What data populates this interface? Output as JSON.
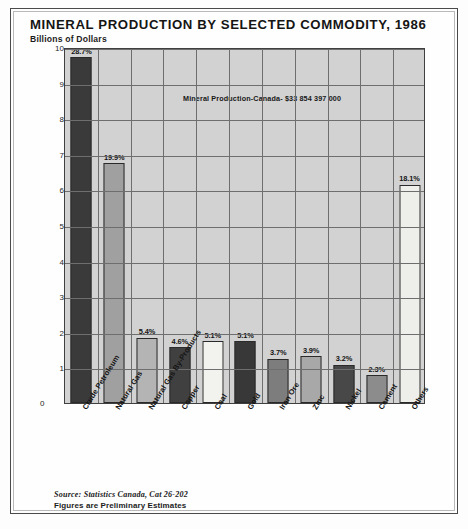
{
  "chart_data": {
    "type": "bar",
    "title": "MINERAL PRODUCTION BY SELECTED COMMODITY, 1986",
    "subtitle": "Billions of Dollars",
    "ylabel": "Billions of Dollars",
    "xlabel": "",
    "ylim": [
      0,
      10
    ],
    "yticks": [
      0,
      1,
      2,
      3,
      4,
      5,
      6,
      7,
      8,
      9,
      10
    ],
    "ytick_labels": [
      "0",
      "1",
      "2",
      "3",
      "4",
      "5",
      "6",
      "7",
      "8",
      "9",
      "10"
    ],
    "grid": true,
    "legend": "none",
    "annotation": "Mineral Production-Canada- $33 854 397 000",
    "value_unit": "billions of dollars",
    "categories": [
      "Crude Petroleum",
      "Natural Gas",
      "Natural Gas By-Products",
      "Copper",
      "Coal",
      "Gold",
      "Iron Ore",
      "Zinc",
      "Nickel",
      "Cement",
      "Others"
    ],
    "values": [
      9.71,
      6.73,
      1.83,
      1.56,
      1.73,
      1.73,
      1.25,
      1.32,
      1.08,
      0.78,
      6.13
    ],
    "data_labels": [
      "28.7%",
      "19.9%",
      "5.4%",
      "4.6%",
      "5.1%",
      "5.1%",
      "3.7%",
      "3.9%",
      "3.2%",
      "2.3%",
      "18.1%"
    ],
    "percent_shares": [
      28.7,
      19.9,
      5.4,
      4.6,
      5.1,
      5.1,
      3.7,
      3.9,
      3.2,
      2.3,
      18.1
    ],
    "bar_colors": [
      "#3a3a3a",
      "#a0a0a0",
      "#b4b4b4",
      "#404040",
      "#f2f2ee",
      "#383838",
      "#7d7d7d",
      "#a8a8a8",
      "#484848",
      "#8c8c8c",
      "#eeeeea"
    ],
    "plot_background": "#d2d2d2",
    "gridline_color": "#6e6e6e",
    "axis_color": "#3f3f3f"
  },
  "footer": {
    "source": "Source: Statistics Canada, Cat 26-202",
    "note": "Figures are Preliminary Estimates"
  }
}
